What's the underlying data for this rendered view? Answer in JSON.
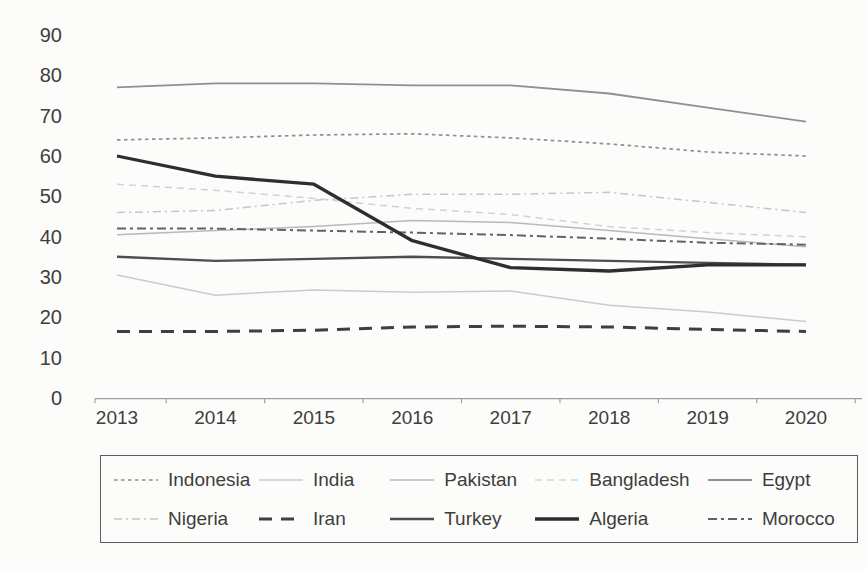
{
  "page": {
    "background": "#fcfcfa",
    "text_color": "#3e3e3e",
    "axis_color": "#9d9d9d",
    "legend_border_color": "#5c5c5c"
  },
  "chart_data": {
    "type": "line",
    "title": "",
    "xlabel": "",
    "ylabel": "",
    "x_categories": [
      "2013",
      "2014",
      "2015",
      "2016",
      "2017",
      "2018",
      "2019",
      "2020"
    ],
    "yticks": [
      "0",
      "10",
      "20",
      "30",
      "40",
      "50",
      "60",
      "70",
      "80",
      "90"
    ],
    "ylim": [
      0,
      90
    ],
    "grid": false,
    "legend_position": "bottom-box",
    "series": [
      {
        "name": "Indonesia",
        "style": "dotted",
        "color": "#8f8f8f",
        "width": 1.7,
        "dash": "3.5 3.5",
        "values": [
          64,
          64.5,
          65.2,
          65.5,
          64.5,
          63,
          61,
          60
        ]
      },
      {
        "name": "India",
        "style": "light-solid",
        "color": "#cbcbcb",
        "width": 1.5,
        "dash": "",
        "values": [
          30.5,
          25.5,
          26.8,
          26.2,
          26.5,
          23,
          21.3,
          19
        ]
      },
      {
        "name": "Pakistan",
        "style": "light-solid",
        "color": "#b9b9b9",
        "width": 1.5,
        "dash": "",
        "values": [
          40.5,
          41.5,
          42.5,
          44,
          43.5,
          41.5,
          39.5,
          37.5
        ]
      },
      {
        "name": "Bangladesh",
        "style": "light-dashed",
        "color": "#d2d2d2",
        "width": 1.5,
        "dash": "7 5",
        "values": [
          53,
          51.5,
          49.5,
          47,
          45.5,
          42.5,
          41,
          40
        ]
      },
      {
        "name": "Egypt",
        "style": "solid",
        "color": "#8d9191",
        "width": 1.8,
        "dash": "",
        "values": [
          77,
          78,
          78,
          77.5,
          77.5,
          75.5,
          72,
          68.5
        ]
      },
      {
        "name": "Nigeria",
        "style": "light-dash-dot",
        "color": "#c6c6c6",
        "width": 1.5,
        "dash": "8 4 2 4",
        "values": [
          46,
          46.5,
          49,
          50.5,
          50.5,
          51,
          48.5,
          46
        ]
      },
      {
        "name": "Iran",
        "style": "bold-dashed",
        "color": "#3f3f3f",
        "width": 3.0,
        "dash": "13 9",
        "values": [
          16.5,
          16.5,
          16.8,
          17.6,
          17.8,
          17.6,
          17,
          16.5
        ]
      },
      {
        "name": "Turkey",
        "style": "dark-solid",
        "color": "#4e4e4e",
        "width": 2.4,
        "dash": "",
        "values": [
          35,
          34,
          34.5,
          35,
          34.5,
          34,
          33.5,
          33
        ]
      },
      {
        "name": "Algeria",
        "style": "bold-solid",
        "color": "#2e2e2e",
        "width": 3.3,
        "dash": "",
        "values": [
          60,
          55,
          53,
          39,
          32.3,
          31.5,
          33,
          33
        ]
      },
      {
        "name": "Morocco",
        "style": "dash-dot-dot",
        "color": "#636363",
        "width": 2.0,
        "dash": "9 4 3 4",
        "values": [
          42,
          42,
          41.5,
          41,
          40.4,
          39.5,
          38.5,
          38
        ]
      }
    ]
  }
}
